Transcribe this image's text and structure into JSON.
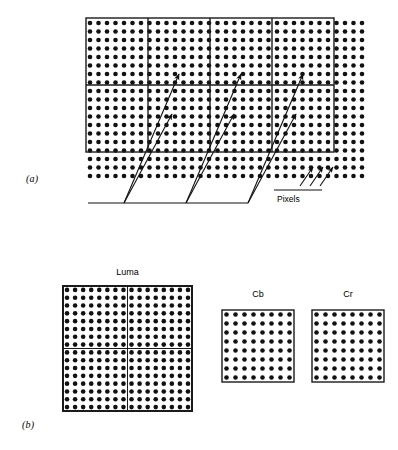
{
  "figure": {
    "panels": [
      {
        "id": "panel-a",
        "label": "(a)",
        "annotation_label": "Pixels",
        "grid": {
          "dot_columns": 33,
          "dot_rows": 19,
          "dot_spacing_px": 8.5,
          "dot_radius_px": 2.3,
          "origin_x": 90,
          "origin_y": 23,
          "dot_color": "#111111"
        },
        "macroblock_region": {
          "x": 86,
          "y": 18,
          "width": 248,
          "height": 134,
          "columns": 4,
          "rows": 2,
          "border_color": "#1a1a1a",
          "border_width": 1.4
        },
        "callout_baseline": {
          "x1": 88,
          "y1": 203,
          "x2": 248,
          "y2": 203
        },
        "callout_groups": [
          {
            "origin_x": 124,
            "targets": [
              [
                179,
                74
              ],
              [
                172,
                114
              ]
            ]
          },
          {
            "origin_x": 186,
            "targets": [
              [
                241,
                74
              ],
              [
                234,
                114
              ]
            ]
          },
          {
            "origin_x": 248,
            "targets": [
              [
                303,
                74
              ],
              [
                296,
                114
              ]
            ]
          }
        ],
        "pixels_pointer": {
          "baseline": {
            "x1": 274,
            "y1": 190,
            "x2": 322,
            "y2": 190
          },
          "arrows": [
            [
              300,
              186,
              313,
              167
            ],
            [
              310,
              186,
              323,
              167
            ],
            [
              320,
              186,
              333,
              167
            ]
          ]
        }
      },
      {
        "id": "panel-b",
        "label": "(b)",
        "blocks": [
          {
            "name": "Luma",
            "caption": "Luma",
            "x": 63,
            "y": 286,
            "width": 129,
            "height": 125,
            "dot_columns": 16,
            "dot_rows": 16,
            "subdivisions": {
              "columns": 2,
              "rows": 2
            },
            "border_width": 2,
            "border_color": "#1a1a1a",
            "dot_color": "#111111",
            "dot_radius_px": 2.3
          },
          {
            "name": "Cb",
            "caption": "Cb",
            "x": 222,
            "y": 310,
            "width": 72,
            "height": 72,
            "dot_columns": 8,
            "dot_rows": 8,
            "subdivisions": {
              "columns": 1,
              "rows": 1
            },
            "border_width": 1.4,
            "border_color": "#1a1a1a",
            "dot_color": "#111111",
            "dot_radius_px": 2.3
          },
          {
            "name": "Cr",
            "caption": "Cr",
            "x": 312,
            "y": 310,
            "width": 72,
            "height": 72,
            "dot_columns": 8,
            "dot_rows": 8,
            "subdivisions": {
              "columns": 1,
              "rows": 1
            },
            "border_width": 1.4,
            "border_color": "#1a1a1a",
            "dot_color": "#111111",
            "dot_radius_px": 2.3
          }
        ]
      }
    ],
    "colors": {
      "background": "#ffffff",
      "ink": "#111111",
      "line": "#1a1a1a"
    }
  }
}
